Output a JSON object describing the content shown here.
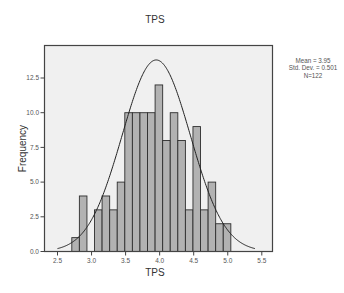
{
  "chart_data": {
    "type": "bar",
    "subtype": "histogram_with_normal_curve",
    "title": "TPS",
    "xlabel": "TPS",
    "ylabel": "Frequency",
    "xlim": [
      2.3,
      5.72
    ],
    "ylim": [
      0,
      14.25
    ],
    "xticks": [
      2.5,
      3.0,
      3.5,
      4.0,
      4.5,
      5.0,
      5.5
    ],
    "xtick_labels": [
      "2.5",
      "3.0",
      "3.5",
      "4.0",
      "4.5",
      "5.0",
      "5.5"
    ],
    "yticks": [
      0,
      2.5,
      5.0,
      7.5,
      10.0,
      12.5
    ],
    "ytick_labels": [
      "0.0",
      "2.5",
      "5.0",
      "7.5",
      "10.0",
      "12.5"
    ],
    "grid": false,
    "legend_position": "right",
    "bin_start": 2.71,
    "bin_width": 0.1112,
    "bin_centers": [
      2.766,
      2.877,
      2.988,
      3.099,
      3.21,
      3.322,
      3.433,
      3.544,
      3.655,
      3.766,
      3.877,
      3.988,
      4.1,
      4.211,
      4.322,
      4.433,
      4.544,
      4.655,
      4.767,
      4.878,
      4.989
    ],
    "values": [
      1,
      4,
      0,
      3,
      4,
      3,
      5,
      10,
      10,
      10,
      10,
      12,
      8,
      10,
      8,
      3,
      9,
      3,
      5,
      2,
      2
    ],
    "normal_curve": {
      "mean": 3.95,
      "std_dev": 0.501,
      "peak_frequency": 13.8
    },
    "annotations": [
      "Mean = 3.95",
      "Std. Dev. = 0.501",
      "N=122"
    ]
  },
  "title": "TPS",
  "xlabel": "TPS",
  "ylabel": "Frequency",
  "stats": {
    "mean": "Mean = 3.95",
    "std": "Std. Dev. = 0.501",
    "n": "N=122"
  },
  "colors": {
    "plot_background": "#f0f0f0",
    "bar_fill": "#b2b2b2",
    "bar_stroke": "#2e2e2e",
    "frame": "#444444",
    "curve": "#222222",
    "tick_text": "#555555"
  }
}
